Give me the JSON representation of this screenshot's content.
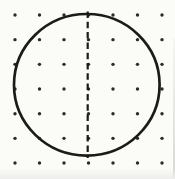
{
  "figure": {
    "type": "dot-paper-symmetry-diagram",
    "width": 175,
    "height": 179,
    "background": "#fbfbf8",
    "ink_color": "#1b1b19",
    "dot_color": "#2b2b29"
  },
  "dot_grid": {
    "rows": 7,
    "cols": 7,
    "origin_x": 15,
    "origin_y": 15,
    "spacing_x": 24.5,
    "spacing_y": 24.67,
    "dot_radius": 1.7
  },
  "circle": {
    "cx": 86.8,
    "cy": 84.8,
    "rx": 72.8,
    "ry": 70.8,
    "stroke_width": 2.7
  },
  "symmetry_line": {
    "x": 87.7,
    "y1": 11.5,
    "y2": 158,
    "stroke_width": 2.2,
    "dash_pattern": "6.5 3.8"
  },
  "scan_artifacts": {
    "bottom_shade_color": "#ededeb",
    "right_edge_color": "#d7d7d5"
  }
}
